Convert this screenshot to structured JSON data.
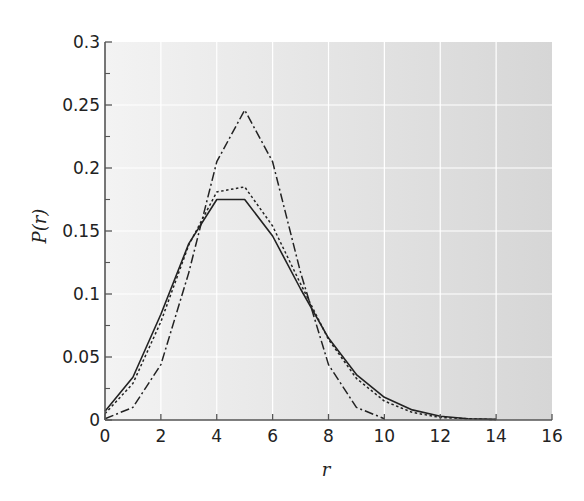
{
  "chart_data": {
    "type": "line",
    "title": "",
    "xlabel": "r",
    "ylabel": "P(r)",
    "xlim": [
      0,
      16
    ],
    "ylim": [
      0,
      0.3
    ],
    "grid": true,
    "legend": null,
    "xticks": [
      "0",
      "2",
      "4",
      "6",
      "8",
      "10",
      "12",
      "14",
      "16"
    ],
    "yticks": [
      "0",
      "0.05",
      "0.1",
      "0.15",
      "0.2",
      "0.25",
      "0.3"
    ],
    "colors": {
      "plot_bg_left": "#f3f3f3",
      "plot_bg_right": "#d6d6d6",
      "grid": "#ffffff",
      "lines": "#222222"
    },
    "series": [
      {
        "name": "solid",
        "style": "solid",
        "x": [
          0,
          1,
          2,
          3,
          4,
          5,
          6,
          7,
          8,
          9,
          10,
          11,
          12,
          13,
          14
        ],
        "values": [
          0.007,
          0.034,
          0.084,
          0.14,
          0.175,
          0.175,
          0.146,
          0.104,
          0.065,
          0.036,
          0.018,
          0.008,
          0.003,
          0.001,
          0.0005
        ]
      },
      {
        "name": "dotted",
        "style": "dotted",
        "x": [
          0,
          1,
          2,
          3,
          4,
          5,
          6,
          7,
          8,
          9,
          10,
          11,
          12,
          13,
          14
        ],
        "values": [
          0.005,
          0.029,
          0.078,
          0.139,
          0.181,
          0.185,
          0.154,
          0.108,
          0.064,
          0.033,
          0.015,
          0.006,
          0.002,
          0.001,
          0.0003
        ]
      },
      {
        "name": "dash-dot",
        "style": "dashdot",
        "x": [
          0,
          1,
          2,
          3,
          4,
          5,
          6,
          7,
          8,
          9,
          10
        ],
        "values": [
          0.001,
          0.01,
          0.044,
          0.117,
          0.205,
          0.246,
          0.205,
          0.117,
          0.044,
          0.01,
          0.001
        ]
      }
    ]
  }
}
